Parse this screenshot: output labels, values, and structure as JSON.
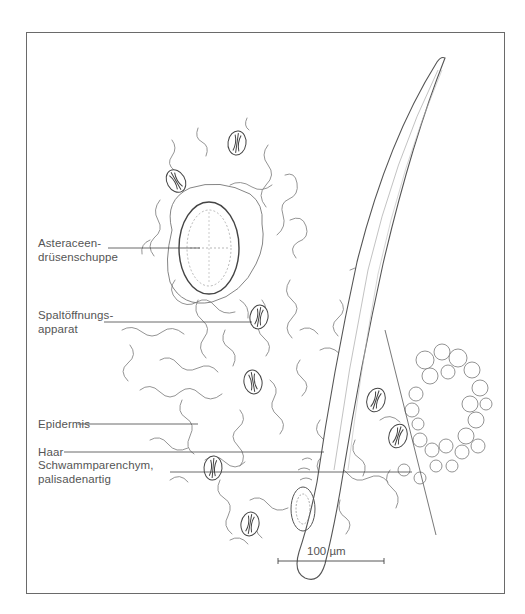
{
  "figure": {
    "type": "botanical-illustration"
  },
  "labels": [
    {
      "id": "asteraceen",
      "lines": [
        "Asteraceen-",
        "drüsenschuppe"
      ]
    },
    {
      "id": "spaltoeffnung",
      "lines": [
        "Spaltöffnungs-",
        "apparat"
      ]
    },
    {
      "id": "epidermis",
      "lines": [
        "Epidermis"
      ]
    },
    {
      "id": "haar",
      "lines": [
        "Haar"
      ]
    },
    {
      "id": "schwamm",
      "lines": [
        "Schwammparenchym,",
        "palisadenartig"
      ]
    }
  ],
  "scale_bar": {
    "label": "100 µm",
    "value": 100,
    "unit": "µm"
  },
  "colors": {
    "ink": "#555555",
    "frame": "#6a6a6a",
    "background": "#ffffff"
  }
}
